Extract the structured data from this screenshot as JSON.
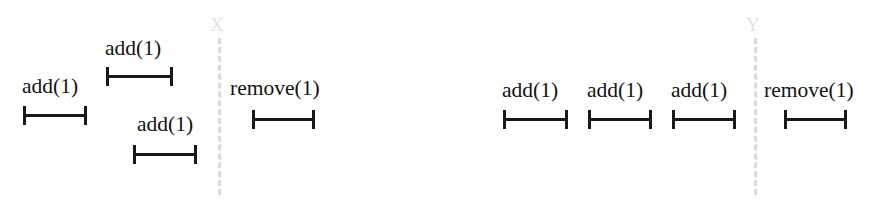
{
  "figure": {
    "background_color": "#ffffff",
    "ink_color": "#181818",
    "divider_color": "#bdbdbd"
  },
  "dividers": [
    {
      "name": "X",
      "label": "X",
      "x": 218,
      "label_x": 210,
      "top": 38,
      "bottom": 195,
      "label_y": 15
    },
    {
      "name": "Y",
      "label": "Y",
      "x": 754,
      "label_x": 746,
      "top": 38,
      "bottom": 195,
      "label_y": 15
    }
  ],
  "operations": [
    {
      "id": "left-add-1",
      "label": "add(1)",
      "group": "left",
      "bar": {
        "x": 23,
        "width": 64,
        "y": 114
      },
      "label_pos": {
        "x": 22,
        "y": 76
      }
    },
    {
      "id": "left-add-2",
      "label": "add(1)",
      "group": "left",
      "bar": {
        "x": 106,
        "width": 67,
        "y": 75
      },
      "label_pos": {
        "x": 105,
        "y": 38
      }
    },
    {
      "id": "left-add-3",
      "label": "add(1)",
      "group": "left",
      "bar": {
        "x": 133,
        "width": 64,
        "y": 153
      },
      "label_pos": {
        "x": 137,
        "y": 114
      }
    },
    {
      "id": "left-remove-1",
      "label": "remove(1)",
      "group": "left",
      "bar": {
        "x": 252,
        "width": 63,
        "y": 118
      },
      "label_pos": {
        "x": 230,
        "y": 78
      }
    },
    {
      "id": "right-add-1",
      "label": "add(1)",
      "group": "right",
      "bar": {
        "x": 503,
        "width": 65,
        "y": 118
      },
      "label_pos": {
        "x": 502,
        "y": 80
      }
    },
    {
      "id": "right-add-2",
      "label": "add(1)",
      "group": "right",
      "bar": {
        "x": 588,
        "width": 64,
        "y": 118
      },
      "label_pos": {
        "x": 587,
        "y": 80
      }
    },
    {
      "id": "right-add-3",
      "label": "add(1)",
      "group": "right",
      "bar": {
        "x": 672,
        "width": 64,
        "y": 118
      },
      "label_pos": {
        "x": 671,
        "y": 80
      }
    },
    {
      "id": "right-remove-1",
      "label": "remove(1)",
      "group": "right",
      "bar": {
        "x": 784,
        "width": 63,
        "y": 118
      },
      "label_pos": {
        "x": 764,
        "y": 80
      }
    }
  ]
}
